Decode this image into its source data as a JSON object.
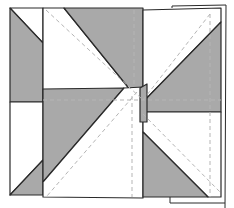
{
  "diagram": {
    "title": "",
    "colors": {
      "gray_fabric": "#a9a9a9",
      "white_fabric": "#ffffff",
      "outline": "#2a2a2a",
      "seam_line": "#b5b5b5"
    },
    "pieces": [
      {
        "id": "top-left-panel",
        "fabric": "gray_and_white"
      },
      {
        "id": "top-center-panel",
        "fabric": "white_and_gray"
      },
      {
        "id": "top-right-panel",
        "fabric": "white_and_gray"
      },
      {
        "id": "bottom-left-panel",
        "fabric": "white_and_gray"
      },
      {
        "id": "bottom-center-panel",
        "fabric": "gray_and_white"
      },
      {
        "id": "bottom-right-panel",
        "fabric": "white_and_gray"
      }
    ],
    "seam_lines": [
      "diagonal-top-center",
      "diagonal-top-right",
      "diagonal-bottom-center",
      "diagonal-bottom-right",
      "horizontal-middle",
      "vertical-right"
    ]
  }
}
